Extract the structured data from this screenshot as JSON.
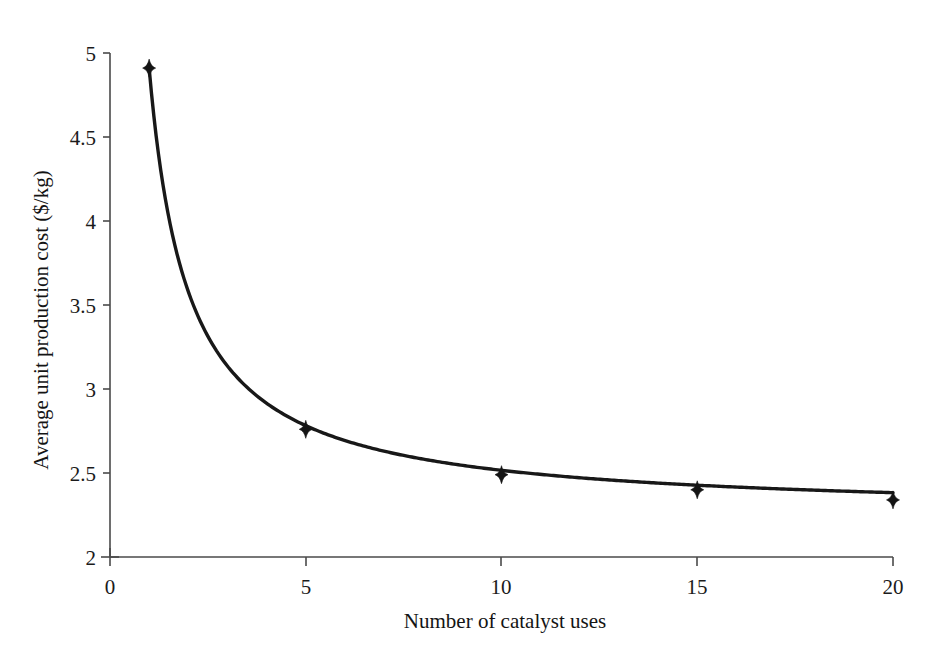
{
  "chart_data": {
    "type": "line",
    "title": "",
    "xlabel": "Number of catalyst uses",
    "ylabel": "Average unit production cost ($/kg)",
    "xlim": [
      0,
      20
    ],
    "ylim": [
      2,
      5
    ],
    "xticks": [
      0,
      5,
      10,
      15,
      20
    ],
    "yticks": [
      2,
      2.5,
      3,
      3.5,
      4,
      4.5,
      5
    ],
    "xtick_labels": [
      "0",
      "5",
      "10",
      "15",
      "20"
    ],
    "ytick_labels": [
      "2",
      "2.5",
      "3",
      "3.5",
      "4",
      "4.5",
      "5"
    ],
    "grid": false,
    "legend": "none",
    "marker": "diamond",
    "line_color": "#181818",
    "marker_color": "#141414",
    "axis_color": "#4a4a4a",
    "background": "#ffffff",
    "x": [
      1,
      5,
      10,
      15,
      20
    ],
    "values": [
      4.91,
      2.76,
      2.49,
      2.4,
      2.34
    ],
    "series": [
      {
        "name": "Average unit production cost",
        "points": [
          {
            "x": 1,
            "y": 4.91
          },
          {
            "x": 5,
            "y": 2.76
          },
          {
            "x": 10,
            "y": 2.49
          },
          {
            "x": 15,
            "y": 2.4
          },
          {
            "x": 20,
            "y": 2.34
          }
        ]
      }
    ],
    "curve_fit": {
      "form": "y = a + b / x",
      "a": 2.25,
      "b": 2.66
    }
  }
}
